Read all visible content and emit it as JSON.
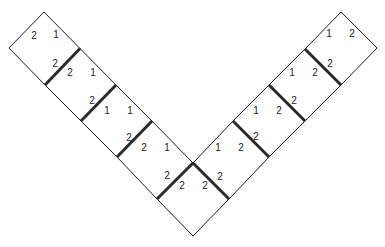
{
  "diagram": {
    "colors": {
      "line": "#1a1a1a",
      "thick_line": "#2b2b2b",
      "text": "#222222",
      "background": "#ffffff"
    },
    "left_strip": [
      {
        "id": "L1",
        "labels": [
          "2",
          "1"
        ]
      },
      {
        "id": "L2",
        "labels": [
          "2",
          "2",
          "1"
        ]
      },
      {
        "id": "L3",
        "labels": [
          "2",
          "1",
          "1"
        ]
      },
      {
        "id": "L4",
        "labels": [
          "2",
          "2",
          "1"
        ]
      }
    ],
    "bottom_tile": {
      "id": "B",
      "labels": [
        "2",
        "2",
        "2",
        "2"
      ]
    },
    "right_strip": [
      {
        "id": "R4",
        "labels": [
          "1",
          "2",
          "2"
        ]
      },
      {
        "id": "R3",
        "labels": [
          "1",
          "2",
          "2"
        ]
      },
      {
        "id": "R2",
        "labels": [
          "1",
          "2",
          "2"
        ]
      },
      {
        "id": "R1",
        "labels": [
          "1",
          "2"
        ]
      }
    ]
  }
}
